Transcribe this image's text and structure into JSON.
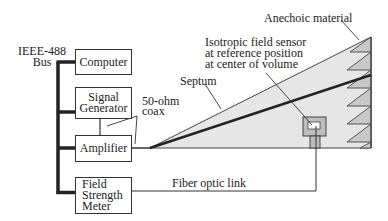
{
  "diagram": {
    "bus_label": [
      "IEEE-488",
      "Bus"
    ],
    "boxes": {
      "computer": [
        "Computer"
      ],
      "signal_generator": [
        "Signal",
        "Generator"
      ],
      "amplifier": [
        "Amplifier"
      ],
      "field_strength_meter": [
        "Field",
        "Strength",
        "Meter"
      ]
    },
    "labels": {
      "coax": [
        "50-ohm",
        "coax"
      ],
      "septum": "Septum",
      "sensor": [
        "Isotropic field sensor",
        "at reference position",
        "at center of volume"
      ],
      "anechoic": "Anechoic material",
      "fiber": "Fiber optic link"
    },
    "colors": {
      "line": "#333333",
      "cell_fill": "#e6e6e6",
      "absorber_fill": "#c8c8c8",
      "sensor_fill": "#bdbdbd"
    }
  }
}
